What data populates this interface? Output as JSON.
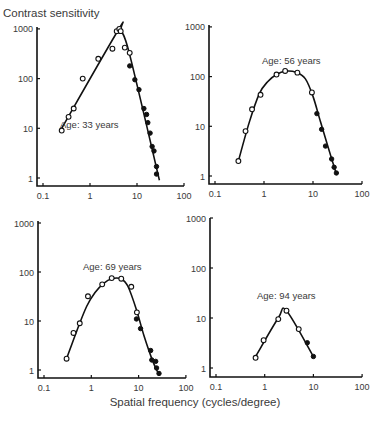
{
  "figure": {
    "ylabel": "Contrast sensitivity",
    "xlabel": "Spatial frequency (cycles/degree)"
  },
  "chart_data": [
    {
      "type": "scatter",
      "title": "Age: 33 years",
      "xlabel": "Spatial frequency (cycles/degree)",
      "ylabel": "Contrast sensitivity",
      "xscale": "log",
      "yscale": "log",
      "xlim": [
        0.1,
        100
      ],
      "ylim": [
        1,
        1000
      ],
      "xticks": [
        "0.1",
        "1",
        "10",
        "100"
      ],
      "yticks": [
        "1",
        "10",
        "100",
        "1000"
      ],
      "grid": false,
      "series": [
        {
          "name": "open",
          "marker": "open-circle",
          "x": [
            0.25,
            0.35,
            0.45,
            0.7,
            1.5,
            3.0,
            3.7,
            4.2,
            4.5,
            5.5,
            7.0
          ],
          "y": [
            9,
            17,
            25,
            100,
            250,
            400,
            900,
            1000,
            900,
            420,
            330
          ]
        },
        {
          "name": "filled",
          "marker": "filled-circle",
          "x": [
            7.0,
            9.0,
            11.0,
            14.0,
            16.0,
            17.0,
            19.0,
            21.0,
            23.0,
            26.0,
            26.0
          ],
          "y": [
            180,
            95,
            60,
            25,
            19,
            13,
            8,
            4.3,
            3.5,
            1.7,
            1.2
          ]
        },
        {
          "name": "fit",
          "marker": "line",
          "x": [
            0.25,
            4.0,
            4.6,
            7.0,
            30.0
          ],
          "y": [
            10,
            950,
            900,
            300,
            0.9
          ]
        }
      ]
    },
    {
      "type": "scatter",
      "title": "Age: 56 years",
      "xlabel": "Spatial frequency (cycles/degree)",
      "ylabel": "Contrast sensitivity",
      "xscale": "log",
      "yscale": "log",
      "xlim": [
        0.1,
        100
      ],
      "ylim": [
        1,
        1000
      ],
      "xticks": [
        "0.1",
        "1",
        "10",
        "100"
      ],
      "yticks": [
        "1",
        "10",
        "100",
        "1000"
      ],
      "grid": false,
      "series": [
        {
          "name": "open",
          "marker": "open-circle",
          "x": [
            0.3,
            0.42,
            0.57,
            0.85,
            1.8,
            2.7,
            4.8,
            9.5
          ],
          "y": [
            2,
            8,
            22,
            43,
            110,
            130,
            120,
            48
          ]
        },
        {
          "name": "filled",
          "marker": "filled-circle",
          "x": [
            12,
            15,
            18,
            24,
            27,
            30
          ],
          "y": [
            18,
            8.7,
            4,
            2.2,
            1.5,
            1.15
          ]
        },
        {
          "name": "fit",
          "marker": "line",
          "x": [
            0.3,
            0.5,
            0.8,
            1.2,
            1.8,
            2.7,
            4.5,
            7,
            10,
            14,
            20,
            30
          ],
          "y": [
            2,
            12,
            45,
            80,
            110,
            128,
            122,
            90,
            40,
            13,
            4,
            1.1
          ]
        }
      ]
    },
    {
      "type": "scatter",
      "title": "Age: 69 years",
      "xlabel": "Spatial frequency (cycles/degree)",
      "ylabel": "Contrast sensitivity",
      "xscale": "log",
      "yscale": "log",
      "xlim": [
        0.1,
        100
      ],
      "ylim": [
        1,
        1000
      ],
      "xticks": [
        "0.1",
        "1",
        "10",
        "100"
      ],
      "yticks": [
        "1",
        "10",
        "100",
        "1000"
      ],
      "grid": false,
      "series": [
        {
          "name": "open",
          "marker": "open-circle",
          "x": [
            0.3,
            0.42,
            0.57,
            0.85,
            1.7,
            2.7,
            4.3,
            7.0,
            9.2
          ],
          "y": [
            1.7,
            5.7,
            9,
            32,
            56,
            75,
            73,
            50,
            15
          ]
        },
        {
          "name": "filled",
          "marker": "filled-circle",
          "x": [
            9.0,
            11.0,
            18.0,
            19.0,
            23.0,
            24.0,
            27.0
          ],
          "y": [
            11,
            7,
            2.5,
            1.6,
            1.5,
            1.1,
            0.85
          ]
        },
        {
          "name": "fit",
          "marker": "line",
          "x": [
            0.3,
            0.5,
            0.8,
            1.2,
            1.8,
            2.7,
            4.3,
            6,
            9,
            13,
            20,
            27
          ],
          "y": [
            1.7,
            6.5,
            20,
            38,
            58,
            73,
            72,
            50,
            17,
            5,
            1.5,
            0.8
          ]
        }
      ]
    },
    {
      "type": "scatter",
      "title": "Age: 94 years",
      "xlabel": "Spatial frequency (cycles/degree)",
      "ylabel": "Contrast sensitivity",
      "xscale": "log",
      "yscale": "log",
      "xlim": [
        0.1,
        100
      ],
      "ylim": [
        1,
        1000
      ],
      "xticks": [
        "0.1",
        "1",
        "10",
        "100"
      ],
      "yticks": [
        "1",
        "10",
        "100",
        "1000"
      ],
      "grid": false,
      "series": [
        {
          "name": "open",
          "marker": "open-circle",
          "x": [
            0.65,
            0.95,
            1.9,
            2.8,
            5.0
          ],
          "y": [
            1.6,
            3.6,
            9.5,
            14,
            6
          ]
        },
        {
          "name": "filled",
          "marker": "filled-circle",
          "x": [
            7.5,
            10.0
          ],
          "y": [
            3.2,
            1.7
          ]
        },
        {
          "name": "fit",
          "marker": "line",
          "x": [
            0.65,
            1.9,
            2.8,
            10.0
          ],
          "y": [
            1.7,
            10,
            14,
            1.7
          ]
        }
      ]
    }
  ],
  "panels_layout": [
    {
      "ox": 37,
      "x01": 43,
      "decade_x": 47,
      "y1": 178,
      "decade_y": 49.7,
      "axis_y": 186,
      "top_y": 27,
      "label_x": 60,
      "label_y": 128
    },
    {
      "ox": 209,
      "x01": 215,
      "decade_x": 49,
      "y1": 176,
      "decade_y": 49.7,
      "axis_y": 184,
      "top_y": 25,
      "label_x": 262,
      "label_y": 64
    },
    {
      "ox": 38,
      "x01": 44,
      "decade_x": 47.3,
      "y1": 370,
      "decade_y": 49,
      "axis_y": 378,
      "top_y": 221,
      "label_x": 83,
      "label_y": 270
    },
    {
      "ox": 210,
      "x01": 216,
      "decade_x": 48.7,
      "y1": 368,
      "decade_y": 50,
      "axis_y": 377,
      "top_y": 218,
      "label_x": 257,
      "label_y": 299
    }
  ]
}
